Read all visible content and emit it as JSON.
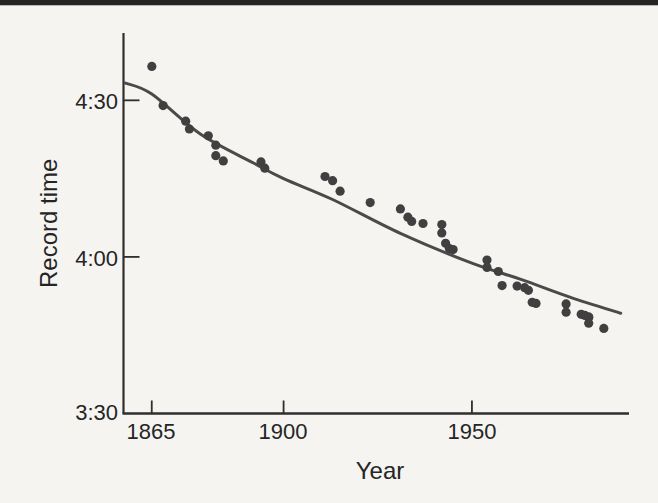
{
  "chart_data": {
    "type": "scatter",
    "title": "",
    "xlabel": "Year",
    "ylabel": "Record time",
    "grid": false,
    "legend": null,
    "xlim": [
      1857.5,
      1991.7
    ],
    "ylim_seconds": [
      210,
      282.9
    ],
    "x_ticks": [
      {
        "value": 1865,
        "label": "1865"
      },
      {
        "value": 1900,
        "label": "1900"
      },
      {
        "value": 1950,
        "label": "1950"
      }
    ],
    "y_ticks": [
      {
        "seconds": 270,
        "label": "4:30"
      },
      {
        "seconds": 240,
        "label": "4:00"
      },
      {
        "seconds": 210,
        "label": "3:30"
      }
    ],
    "points": [
      {
        "year": 1865,
        "time": "4:36.5",
        "seconds": 276.5
      },
      {
        "year": 1868,
        "time": "4:29.0",
        "seconds": 269.0
      },
      {
        "year": 1874,
        "time": "4:26.0",
        "seconds": 266.0
      },
      {
        "year": 1875,
        "time": "4:24.5",
        "seconds": 264.5
      },
      {
        "year": 1880,
        "time": "4:23.2",
        "seconds": 263.2
      },
      {
        "year": 1882,
        "time": "4:21.4",
        "seconds": 261.4
      },
      {
        "year": 1882,
        "time": "4:19.4",
        "seconds": 259.4
      },
      {
        "year": 1884,
        "time": "4:18.4",
        "seconds": 258.4
      },
      {
        "year": 1894,
        "time": "4:18.2",
        "seconds": 258.2
      },
      {
        "year": 1895,
        "time": "4:17.0",
        "seconds": 257.0
      },
      {
        "year": 1911,
        "time": "4:15.4",
        "seconds": 255.4
      },
      {
        "year": 1913,
        "time": "4:14.6",
        "seconds": 254.6
      },
      {
        "year": 1915,
        "time": "4:12.6",
        "seconds": 252.6
      },
      {
        "year": 1923,
        "time": "4:10.4",
        "seconds": 250.4
      },
      {
        "year": 1931,
        "time": "4:09.2",
        "seconds": 249.2
      },
      {
        "year": 1933,
        "time": "4:07.6",
        "seconds": 247.6
      },
      {
        "year": 1934,
        "time": "4:06.8",
        "seconds": 246.8
      },
      {
        "year": 1937,
        "time": "4:06.4",
        "seconds": 246.4
      },
      {
        "year": 1942,
        "time": "4:06.2",
        "seconds": 246.2
      },
      {
        "year": 1942,
        "time": "4:04.6",
        "seconds": 244.6
      },
      {
        "year": 1943,
        "time": "4:02.6",
        "seconds": 242.6
      },
      {
        "year": 1944,
        "time": "4:01.6",
        "seconds": 241.6
      },
      {
        "year": 1945,
        "time": "4:01.4",
        "seconds": 241.4
      },
      {
        "year": 1954,
        "time": "3:59.4",
        "seconds": 239.4
      },
      {
        "year": 1954,
        "time": "3:58.0",
        "seconds": 238.0
      },
      {
        "year": 1957,
        "time": "3:57.2",
        "seconds": 237.2
      },
      {
        "year": 1958,
        "time": "3:54.5",
        "seconds": 234.5
      },
      {
        "year": 1962,
        "time": "3:54.4",
        "seconds": 234.4
      },
      {
        "year": 1964,
        "time": "3:54.1",
        "seconds": 234.1
      },
      {
        "year": 1965,
        "time": "3:53.6",
        "seconds": 233.6
      },
      {
        "year": 1966,
        "time": "3:51.3",
        "seconds": 231.3
      },
      {
        "year": 1967,
        "time": "3:51.1",
        "seconds": 231.1
      },
      {
        "year": 1975,
        "time": "3:51.0",
        "seconds": 231.0
      },
      {
        "year": 1975,
        "time": "3:49.4",
        "seconds": 229.4
      },
      {
        "year": 1979,
        "time": "3:49.0",
        "seconds": 229.0
      },
      {
        "year": 1980,
        "time": "3:48.8",
        "seconds": 228.8
      },
      {
        "year": 1981,
        "time": "3:48.5",
        "seconds": 228.5
      },
      {
        "year": 1981,
        "time": "3:48.4",
        "seconds": 228.4
      },
      {
        "year": 1981,
        "time": "3:47.3",
        "seconds": 227.3
      },
      {
        "year": 1985,
        "time": "3:46.3",
        "seconds": 226.3
      }
    ],
    "trend_curve": [
      {
        "year": 1858.0,
        "seconds": 273.3
      },
      {
        "year": 1865.0,
        "seconds": 271.2
      },
      {
        "year": 1878.0,
        "seconds": 263.5
      },
      {
        "year": 1892.0,
        "seconds": 258.0
      },
      {
        "year": 1900.0,
        "seconds": 255.0
      },
      {
        "year": 1913.0,
        "seconds": 251.0
      },
      {
        "year": 1931.0,
        "seconds": 244.5
      },
      {
        "year": 1950.0,
        "seconds": 238.8
      },
      {
        "year": 1963.0,
        "seconds": 235.7
      },
      {
        "year": 1976.0,
        "seconds": 232.3
      },
      {
        "year": 1989.5,
        "seconds": 229.2
      }
    ],
    "colors": {
      "background": "#f5f4f1",
      "top_bar": "#242424",
      "axis": "#2f2f2f",
      "text": "#252525",
      "point": "#404040",
      "curve": "#4a4a4a"
    }
  }
}
